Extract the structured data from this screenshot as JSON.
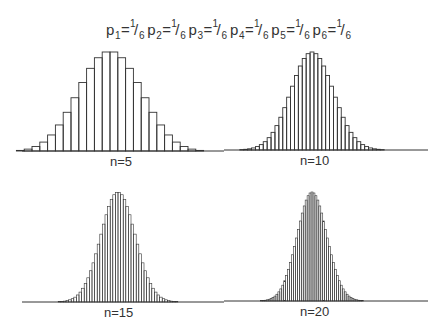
{
  "title": {
    "items": [
      {
        "p": "p",
        "sub": "1",
        "eq": "=",
        "num": "1",
        "slash": "/",
        "den": "6"
      },
      {
        "p": "p",
        "sub": "2",
        "eq": "=",
        "num": "1",
        "slash": "/",
        "den": "6"
      },
      {
        "p": "p",
        "sub": "3",
        "eq": "=",
        "num": "1",
        "slash": "/",
        "den": "6"
      },
      {
        "p": "p",
        "sub": "4",
        "eq": "=",
        "num": "1",
        "slash": "/",
        "den": "6"
      },
      {
        "p": "p",
        "sub": "5",
        "eq": "=",
        "num": "1",
        "slash": "/",
        "den": "6"
      },
      {
        "p": "p",
        "sub": "6",
        "eq": "=",
        "num": "1",
        "slash": "/",
        "den": "6"
      }
    ]
  },
  "colors": {
    "line": "#333333",
    "background": "#ffffff"
  },
  "chart_data": [
    {
      "type": "bar",
      "title": "n=5",
      "description": "Distribution of sum of 5 fair dice (heights normalized to peak)",
      "x_start": 5,
      "values": [
        0.001,
        0.006,
        0.019,
        0.045,
        0.09,
        0.162,
        0.263,
        0.391,
        0.538,
        0.692,
        0.835,
        0.942,
        1.0,
        1.0,
        0.942,
        0.835,
        0.692,
        0.538,
        0.391,
        0.263,
        0.162,
        0.09,
        0.045,
        0.019,
        0.006,
        0.001
      ],
      "layout": {
        "baseline_y": 151,
        "peak_height": 99,
        "axis_x0": 22,
        "axis_x1": 224,
        "center_x": 110,
        "bar_width": 7.8,
        "label_x": 110,
        "label_y": 154
      }
    },
    {
      "type": "bar",
      "title": "n=10",
      "description": "Distribution of sum of 10 fair dice (heights normalized to peak)",
      "x_start": 10,
      "values": [
        0,
        0,
        0,
        0,
        0,
        0.001,
        0.002,
        0.004,
        0.007,
        0.012,
        0.021,
        0.035,
        0.055,
        0.085,
        0.126,
        0.18,
        0.249,
        0.334,
        0.432,
        0.539,
        0.651,
        0.76,
        0.857,
        0.934,
        0.983,
        1.0,
        0.983,
        0.934,
        0.857,
        0.76,
        0.651,
        0.539,
        0.432,
        0.334,
        0.249,
        0.18,
        0.126,
        0.085,
        0.055,
        0.035,
        0.021,
        0.012,
        0.007,
        0.004,
        0.002,
        0.001,
        0,
        0,
        0,
        0,
        0
      ],
      "layout": {
        "baseline_y": 150,
        "peak_height": 98,
        "axis_x0": 224,
        "axis_x1": 428,
        "center_x": 312,
        "bar_width": 3.9,
        "label_x": 300,
        "label_y": 153
      }
    },
    {
      "type": "bar",
      "title": "n=15",
      "description": "Distribution of sum of 15 fair dice (heights normalized to peak)",
      "x_start": 15,
      "values": [
        0,
        0,
        0,
        0,
        0,
        0,
        0,
        0,
        0,
        0,
        0,
        0,
        0,
        0.001,
        0.002,
        0.003,
        0.005,
        0.008,
        0.013,
        0.02,
        0.03,
        0.044,
        0.064,
        0.09,
        0.125,
        0.168,
        0.22,
        0.284,
        0.356,
        0.438,
        0.526,
        0.617,
        0.708,
        0.793,
        0.869,
        0.931,
        0.975,
        0.997,
        0.997,
        0.975,
        0.931,
        0.869,
        0.793,
        0.708,
        0.617,
        0.526,
        0.438,
        0.356,
        0.284,
        0.22,
        0.168,
        0.125,
        0.09,
        0.064,
        0.044,
        0.03,
        0.02,
        0.013,
        0.008,
        0.005,
        0.003,
        0.002,
        0.001,
        0,
        0,
        0,
        0,
        0,
        0,
        0,
        0,
        0,
        0,
        0,
        0,
        0
      ],
      "layout": {
        "baseline_y": 302,
        "peak_height": 110,
        "axis_x0": 22,
        "axis_x1": 224,
        "center_x": 118,
        "bar_width": 2.6,
        "label_x": 104,
        "label_y": 305
      }
    },
    {
      "type": "bar",
      "title": "n=20",
      "description": "Distribution of sum of 20 fair dice (heights normalized to peak)",
      "x_start": 20,
      "values": [
        0,
        0,
        0,
        0,
        0,
        0,
        0,
        0,
        0,
        0,
        0,
        0,
        0,
        0,
        0,
        0,
        0,
        0,
        0,
        0,
        0,
        0,
        0.001,
        0.002,
        0.003,
        0.005,
        0.007,
        0.011,
        0.016,
        0.023,
        0.032,
        0.045,
        0.062,
        0.084,
        0.111,
        0.145,
        0.186,
        0.235,
        0.291,
        0.354,
        0.424,
        0.499,
        0.578,
        0.657,
        0.734,
        0.807,
        0.872,
        0.926,
        0.966,
        0.991,
        1.0,
        0.991,
        0.966,
        0.926,
        0.872,
        0.807,
        0.734,
        0.657,
        0.578,
        0.499,
        0.424,
        0.354,
        0.291,
        0.235,
        0.186,
        0.145,
        0.111,
        0.084,
        0.062,
        0.045,
        0.032,
        0.023,
        0.016,
        0.011,
        0.007,
        0.005,
        0.003,
        0.002,
        0.001,
        0,
        0,
        0,
        0,
        0,
        0,
        0,
        0,
        0,
        0,
        0,
        0,
        0,
        0,
        0,
        0,
        0,
        0,
        0,
        0,
        0,
        0
      ],
      "layout": {
        "baseline_y": 301,
        "peak_height": 109,
        "axis_x0": 224,
        "axis_x1": 428,
        "center_x": 312,
        "bar_width": 1.95,
        "label_x": 300,
        "label_y": 304
      }
    }
  ]
}
